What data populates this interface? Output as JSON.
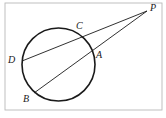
{
  "figure": {
    "kind": "geometry-diagram",
    "width": 166,
    "height": 118,
    "background_color": "#ffffff",
    "stroke_color": "#1a1a1a",
    "frame": {
      "visible": true,
      "color": "#b9b9b9",
      "x": 5,
      "y": 3,
      "width": 157,
      "height": 107
    },
    "circle": {
      "cx": 58.5,
      "cy": 64.5,
      "r": 36.5,
      "stroke_width": 1.5,
      "color": "#1a1a1a"
    },
    "points": [
      {
        "id": "P",
        "label": "P",
        "x": 147,
        "y": 11,
        "label_x": 150,
        "label_y": 3,
        "position": "external-upper-right"
      },
      {
        "id": "C",
        "label": "C",
        "x": 82,
        "y": 35,
        "label_x": 76,
        "label_y": 22,
        "position": "circle-upper-right"
      },
      {
        "id": "A",
        "label": "A",
        "x": 93,
        "y": 55,
        "label_x": 96,
        "label_y": 51,
        "position": "circle-right"
      },
      {
        "id": "D",
        "label": "D",
        "x": 22,
        "y": 61,
        "label_x": 9,
        "label_y": 55,
        "position": "circle-left"
      },
      {
        "id": "B",
        "label": "B",
        "x": 34,
        "y": 93,
        "label_x": 24,
        "label_y": 94,
        "position": "circle-lower-left"
      }
    ],
    "secants": [
      {
        "id": "secant-DCP",
        "label": "D-C-P",
        "from": "D",
        "through": "C",
        "to": "P",
        "x1": 22,
        "y1": 61,
        "x2": 147,
        "y2": 11,
        "stroke_width": 0.9
      },
      {
        "id": "secant-BAP",
        "label": "B-A-P",
        "from": "B",
        "through": "A",
        "to": "P",
        "x1": 34,
        "y1": 93,
        "x2": 147,
        "y2": 11,
        "stroke_width": 0.9
      }
    ]
  }
}
